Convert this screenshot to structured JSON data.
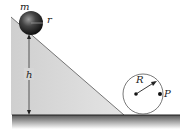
{
  "diagram": {
    "labels": {
      "mass": "m",
      "ball_radius": "r",
      "height": "h",
      "wheel_radius": "R",
      "point": "P"
    },
    "colors": {
      "incline_fill": "#d9d9d9",
      "incline_edge": "#555555",
      "ground": "#2a2a2a",
      "ball_dark": "#1a1a1a",
      "ball_light": "#8a8a8a",
      "wheel_stroke": "#555555",
      "text": "#222222"
    }
  }
}
